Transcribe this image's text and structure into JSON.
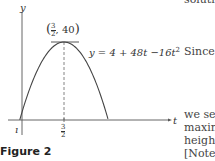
{
  "chart_data": {
    "type": "line",
    "title": "",
    "equation": "y = 4 + 48t −16t²",
    "xlabel": "t",
    "ylabel": "y",
    "vertex_label": "(3/2, 40)",
    "vertex": [
      1.5,
      40
    ],
    "x_ticks": [
      {
        "value": 1.5,
        "label": "3/2"
      }
    ],
    "xlim": [
      -0.3,
      3.9
    ],
    "ylim": [
      -4,
      50
    ],
    "curve": {
      "a": -16,
      "b": 48,
      "c": 4
    },
    "grid": false
  },
  "figure": {
    "caption": "Figure 2",
    "equation_label": "y = 4 + 48t −16t",
    "equation_exp": "2",
    "vertex_num": "3",
    "vertex_den": "2",
    "vertex_y": ", 40",
    "tick_num": "3",
    "tick_den": "2",
    "xlabel": "t",
    "ylabel": "y"
  },
  "body_text": {
    "top": "solutio",
    "since": "Since",
    "line1": "we se",
    "line2": "maxin",
    "line3": "heigh",
    "line4": "[Note"
  }
}
